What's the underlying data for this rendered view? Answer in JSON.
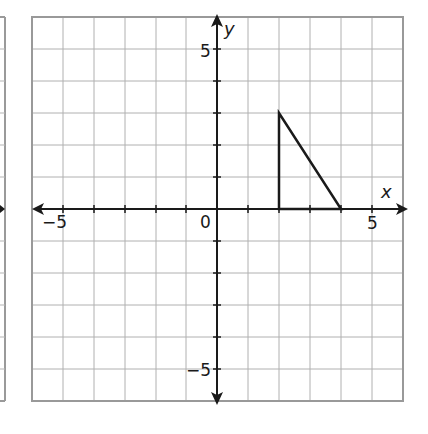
{
  "figure": {
    "type": "coordinate-plane",
    "x_axis": {
      "label": "x",
      "min": -6,
      "max": 6,
      "tick_labels": [
        "−5",
        "5"
      ],
      "origin_label": "0"
    },
    "y_axis": {
      "label": "y",
      "min": -6,
      "max": 6,
      "tick_labels": [
        "5",
        "−5"
      ]
    },
    "grid": true,
    "shape": {
      "name": "triangle",
      "vertices": [
        [
          2,
          0
        ],
        [
          2,
          3
        ],
        [
          4,
          0
        ]
      ]
    },
    "partial_left_graph": true
  },
  "labels": {
    "x": "x",
    "y": "y",
    "origin": "0",
    "x_neg5": "−5",
    "x_pos5": "5",
    "y_pos5": "5",
    "y_neg5": "−5"
  },
  "colors": {
    "grid": "#aaaaaa",
    "border": "#999999",
    "axis": "#1a1a1a",
    "shape": "#1a1a1a"
  }
}
